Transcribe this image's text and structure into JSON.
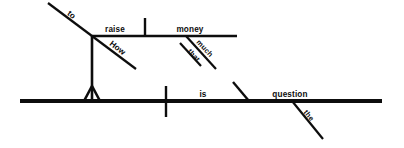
{
  "diagram": {
    "type": "reed-kellogg-sentence-diagram",
    "sentence": "How to raise that much money is the question.",
    "ink_color": "#0d0d0d",
    "background_color": "#ffffff",
    "words": {
      "to": "to",
      "raise": "raise",
      "how": "How",
      "money": "money",
      "much": "much",
      "that": "that",
      "is": "is",
      "question": "question",
      "the": "the"
    },
    "clause": {
      "infinitive_particle": "to",
      "verb": "raise",
      "adverb": "How",
      "object": "money",
      "object_modifiers": [
        "much",
        "that"
      ]
    },
    "main": {
      "subject_slot": "infinitive phrase",
      "verb": "is",
      "predicate_nominative": "question",
      "article": "the"
    }
  }
}
